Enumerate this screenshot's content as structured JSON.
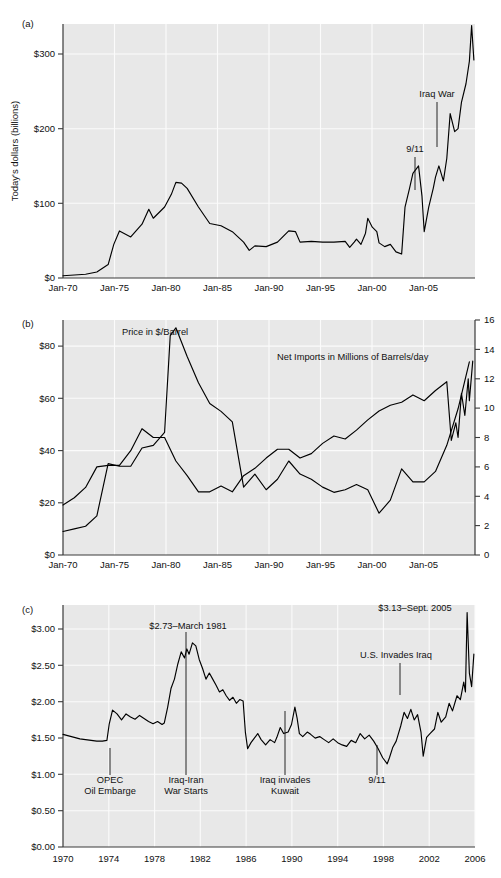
{
  "figure": {
    "panels": [
      {
        "label": "(a)",
        "ylabel": "Today's dollars (billions)",
        "yticks": [
          "$0",
          "$100",
          "$200",
          "$300"
        ],
        "xticks": [
          "Jan-70",
          "Jan-75",
          "Jan-80",
          "Jan-85",
          "Jan-90",
          "Jan-95",
          "Jan-00",
          "Jan-05"
        ],
        "annotations": [
          {
            "text": "Iraq War"
          },
          {
            "text": "9/11"
          }
        ]
      },
      {
        "label": "(b)",
        "yticks_left": [
          "$0",
          "$20",
          "$40",
          "$60",
          "$80"
        ],
        "yticks_right": [
          "0",
          "2",
          "4",
          "6",
          "8",
          "10",
          "12",
          "14",
          "16"
        ],
        "xticks": [
          "Jan-70",
          "Jan-75",
          "Jan-80",
          "Jan-85",
          "Jan-90",
          "Jan-95",
          "Jan-00",
          "Jan-05"
        ],
        "annotations": [
          {
            "text": "Price in $/Barrel"
          },
          {
            "text": "Net Imports in Millions of Barrels/day"
          }
        ]
      },
      {
        "label": "(c)",
        "yticks": [
          "$0.00",
          "$0.50",
          "$1.00",
          "$1.50",
          "$2.00",
          "$2.50",
          "$3.00"
        ],
        "xticks": [
          "1970",
          "1974",
          "1978",
          "1982",
          "1986",
          "1990",
          "1994",
          "1998",
          "2002",
          "2006"
        ],
        "annotations": [
          {
            "text": "$2.73–March 1981"
          },
          {
            "text": "$3.13–Sept. 2005"
          },
          {
            "text": "U.S. Invades Iraq"
          },
          {
            "text": "OPEC"
          },
          {
            "text": "Oil Embarge"
          },
          {
            "text": "Iraq-Iran"
          },
          {
            "text": "War Starts"
          },
          {
            "text": "Iraq invades"
          },
          {
            "text": "Kuwait"
          },
          {
            "text": "9/11"
          }
        ]
      }
    ]
  },
  "chart_data": [
    {
      "type": "line",
      "panel": "(a)",
      "title": "",
      "xlabel": "",
      "ylabel": "Today's dollars (billions)",
      "xlim": [
        1970,
        2006.5
      ],
      "ylim": [
        0,
        340
      ],
      "yticks": [
        0,
        100,
        200,
        300
      ],
      "ytick_labels": [
        "$0",
        "$100",
        "$200",
        "$300"
      ],
      "xticks": [
        1970,
        1975,
        1980,
        1985,
        1990,
        1995,
        2000,
        2005
      ],
      "xtick_labels": [
        "Jan-70",
        "Jan-75",
        "Jan-80",
        "Jan-85",
        "Jan-90",
        "Jan-95",
        "Jan-00",
        "Jan-05"
      ],
      "grid": true,
      "legend": "none",
      "series": [
        {
          "name": "Cost of net petroleum imports (today's dollars, billions)",
          "x": [
            1970,
            1971,
            1972,
            1973,
            1974,
            1974.5,
            1975,
            1976,
            1977,
            1977.6,
            1978,
            1979,
            1979.6,
            1980,
            1980.5,
            1981,
            1982,
            1983,
            1984,
            1985,
            1986,
            1986.5,
            1987,
            1988,
            1989,
            1990,
            1990.6,
            1991,
            1992,
            1993,
            1994,
            1995,
            1995.4,
            1995.8,
            1996,
            1996.4,
            1996.8,
            1997,
            1997.4,
            1997.8,
            1998,
            1998.5,
            1999,
            1999.5,
            2000,
            2000.3,
            2000.7,
            2001,
            2001.5,
            2001.8,
            2002,
            2002.4,
            2002.8,
            2003,
            2003.3,
            2003.7,
            2004,
            2004.3,
            2004.7,
            2005,
            2005.3,
            2005.7,
            2006,
            2006.2,
            2006.4
          ],
          "y": [
            3,
            4,
            5,
            8,
            18,
            45,
            63,
            55,
            72,
            92,
            80,
            95,
            112,
            128,
            127,
            120,
            95,
            73,
            70,
            62,
            48,
            37,
            43,
            42,
            48,
            63,
            62,
            48,
            49,
            48,
            48,
            49,
            41,
            48,
            52,
            45,
            60,
            80,
            68,
            62,
            47,
            42,
            45,
            35,
            32,
            95,
            120,
            140,
            150,
            110,
            62,
            95,
            120,
            135,
            150,
            130,
            160,
            220,
            196,
            200,
            235,
            260,
            290,
            338,
            292
          ]
        }
      ],
      "annotations": [
        {
          "text": "Iraq War",
          "x": 2003.2,
          "y": 250
        },
        {
          "text": "9/11",
          "x": 2001.6,
          "y": 178
        }
      ]
    },
    {
      "type": "line",
      "panel": "(b)",
      "title": "",
      "xlabel": "",
      "ylabel_left": "Price in $/Barrel",
      "ylabel_right": "Net Imports in Millions of Barrels/day",
      "xlim": [
        1970,
        2006.5
      ],
      "ylim_left": [
        0,
        90
      ],
      "ylim_right": [
        0,
        16
      ],
      "yticks_left": [
        0,
        20,
        40,
        60,
        80
      ],
      "ytick_labels_left": [
        "$0",
        "$20",
        "$40",
        "$60",
        "$80"
      ],
      "yticks_right": [
        0,
        2,
        4,
        6,
        8,
        10,
        12,
        14,
        16
      ],
      "ytick_labels_right": [
        "0",
        "2",
        "4",
        "6",
        "8",
        "10",
        "12",
        "14",
        "16"
      ],
      "xticks": [
        1970,
        1975,
        1980,
        1985,
        1990,
        1995,
        2000,
        2005
      ],
      "xtick_labels": [
        "Jan-70",
        "Jan-75",
        "Jan-80",
        "Jan-85",
        "Jan-90",
        "Jan-95",
        "Jan-00",
        "Jan-05"
      ],
      "grid": true,
      "legend": "inline-labels",
      "series": [
        {
          "name": "Price in $/Barrel",
          "axis": "left",
          "x": [
            1970,
            1971,
            1972,
            1973,
            1974,
            1975,
            1976,
            1977,
            1978,
            1979,
            1979.5,
            1980,
            1981,
            1982,
            1983,
            1984,
            1985,
            1986,
            1987,
            1988,
            1989,
            1990,
            1991,
            1992,
            1993,
            1994,
            1995,
            1996,
            1997,
            1998,
            1999,
            2000,
            2001,
            2002,
            2003,
            2004,
            2005,
            2006
          ],
          "y": [
            9,
            10,
            11,
            15,
            35,
            34,
            34,
            41,
            42,
            47,
            84,
            87,
            76,
            66,
            58,
            55,
            51,
            26,
            31,
            25,
            29,
            36,
            31,
            29,
            26,
            24,
            25,
            27,
            25,
            16,
            21,
            33,
            28,
            28,
            32,
            42,
            56,
            74
          ]
        },
        {
          "name": "Net Imports in Millions of Barrels/day",
          "axis": "right",
          "x": [
            1970,
            1971,
            1972,
            1973,
            1974,
            1975,
            1976,
            1977,
            1978,
            1979,
            1980,
            1981,
            1982,
            1983,
            1984,
            1985,
            1986,
            1987,
            1988,
            1989,
            1990,
            1991,
            1992,
            1993,
            1994,
            1995,
            1996,
            1997,
            1998,
            1999,
            2000,
            2001,
            2002,
            2003,
            2004,
            2004.4,
            2004.8,
            2005,
            2005.3,
            2005.6,
            2005.9,
            2006,
            2006.3
          ],
          "y": [
            3.4,
            3.9,
            4.6,
            6.0,
            6.1,
            6.1,
            7.1,
            8.6,
            8.0,
            8.0,
            6.4,
            5.4,
            4.3,
            4.3,
            4.7,
            4.3,
            5.4,
            5.9,
            6.6,
            7.2,
            7.2,
            6.6,
            6.9,
            7.6,
            8.1,
            7.9,
            8.5,
            9.2,
            9.8,
            10.2,
            10.4,
            10.9,
            10.5,
            11.2,
            11.8,
            7.8,
            9.0,
            8.0,
            11.0,
            9.5,
            12.0,
            10.5,
            13.2
          ]
        }
      ],
      "annotations": [
        {
          "text": "Price in $/Barrel",
          "x": 1975.5,
          "y": 88
        },
        {
          "text": "Net Imports in Millions of Barrels/day",
          "x": 1994,
          "y": 78
        }
      ]
    },
    {
      "type": "line",
      "panel": "(c)",
      "title": "",
      "xlabel": "",
      "ylabel": "Retail gasoline price, $/gallon (today's dollars)",
      "xlim": [
        1970,
        2006.6
      ],
      "ylim": [
        0,
        3.2
      ],
      "yticks": [
        0,
        0.5,
        1.0,
        1.5,
        2.0,
        2.5,
        3.0
      ],
      "ytick_labels": [
        "$0.00",
        "$0.50",
        "$1.00",
        "$1.50",
        "$2.00",
        "$2.50",
        "$3.00"
      ],
      "xticks": [
        1970,
        1974,
        1978,
        1982,
        1986,
        1990,
        1994,
        1998,
        2002,
        2006
      ],
      "xtick_labels": [
        "1970",
        "1974",
        "1978",
        "1982",
        "1986",
        "1990",
        "1994",
        "1998",
        "2002",
        "2006"
      ],
      "grid": true,
      "legend": "none",
      "series": [
        {
          "name": "Real gasoline price ($/gallon)",
          "x": [
            1970,
            1970.5,
            1971,
            1971.5,
            1972,
            1972.5,
            1973,
            1973.5,
            1973.9,
            1974.1,
            1974.4,
            1974.8,
            1975.2,
            1975.6,
            1976,
            1976.4,
            1976.8,
            1977.2,
            1977.6,
            1978,
            1978.4,
            1978.8,
            1979,
            1979.3,
            1979.6,
            1979.9,
            1980.2,
            1980.5,
            1980.8,
            1981,
            1981.2,
            1981.5,
            1981.8,
            1982.1,
            1982.4,
            1982.7,
            1983,
            1983.3,
            1983.6,
            1983.9,
            1984.2,
            1984.5,
            1984.8,
            1985.1,
            1985.4,
            1985.7,
            1986,
            1986.2,
            1986.4,
            1986.7,
            1987,
            1987.3,
            1987.6,
            1988,
            1988.4,
            1988.8,
            1989,
            1989.3,
            1989.6,
            1990,
            1990.3,
            1990.6,
            1990.8,
            1991,
            1991.3,
            1991.7,
            1992,
            1992.4,
            1992.8,
            1993.2,
            1993.6,
            1994,
            1994.4,
            1994.8,
            1995.2,
            1995.6,
            1996,
            1996.4,
            1996.8,
            1997.2,
            1997.6,
            1998,
            1998.4,
            1998.8,
            1999,
            1999.3,
            1999.6,
            2000,
            2000.3,
            2000.6,
            2000.9,
            2001.2,
            2001.5,
            2001.8,
            2002,
            2002.3,
            2002.6,
            2003,
            2003.3,
            2003.6,
            2004,
            2004.3,
            2004.6,
            2005,
            2005.3,
            2005.6,
            2005.75,
            2005.9,
            2006.1,
            2006.3,
            2006.5
          ],
          "y": [
            1.49,
            1.47,
            1.45,
            1.43,
            1.42,
            1.41,
            1.4,
            1.4,
            1.41,
            1.62,
            1.81,
            1.76,
            1.68,
            1.76,
            1.72,
            1.69,
            1.74,
            1.7,
            1.66,
            1.63,
            1.66,
            1.62,
            1.64,
            1.85,
            2.1,
            2.22,
            2.42,
            2.58,
            2.5,
            2.62,
            2.55,
            2.7,
            2.66,
            2.48,
            2.36,
            2.22,
            2.3,
            2.22,
            2.14,
            2.05,
            2.08,
            2.0,
            1.94,
            1.98,
            1.9,
            1.95,
            1.93,
            1.52,
            1.3,
            1.38,
            1.44,
            1.5,
            1.42,
            1.35,
            1.42,
            1.38,
            1.45,
            1.58,
            1.5,
            1.52,
            1.62,
            1.85,
            1.7,
            1.5,
            1.46,
            1.52,
            1.49,
            1.44,
            1.46,
            1.42,
            1.38,
            1.43,
            1.38,
            1.35,
            1.33,
            1.41,
            1.38,
            1.5,
            1.43,
            1.48,
            1.4,
            1.3,
            1.18,
            1.1,
            1.18,
            1.32,
            1.4,
            1.6,
            1.78,
            1.7,
            1.82,
            1.68,
            1.75,
            1.52,
            1.2,
            1.45,
            1.5,
            1.56,
            1.78,
            1.65,
            1.72,
            1.9,
            1.8,
            2.0,
            1.95,
            2.18,
            2.05,
            3.1,
            2.3,
            2.12,
            2.55,
            2.9
          ]
        }
      ],
      "annotations": [
        {
          "text": "$2.73–March 1981",
          "x": 1981.4,
          "y": 2.93
        },
        {
          "text": "$3.13–Sept. 2005",
          "x": 2004.0,
          "y": 3.13
        },
        {
          "text": "U.S. Invades Iraq",
          "x": 2002.4,
          "y": 2.4
        },
        {
          "text": "OPEC Oil Embarge",
          "x": 1974.0,
          "y": 0.86
        },
        {
          "text": "Iraq-Iran War Starts",
          "x": 1980.9,
          "y": 0.86
        },
        {
          "text": "Iraq invades Kuwait",
          "x": 1990.6,
          "y": 0.86
        },
        {
          "text": "9/11",
          "x": 2001.5,
          "y": 0.86
        }
      ]
    }
  ]
}
